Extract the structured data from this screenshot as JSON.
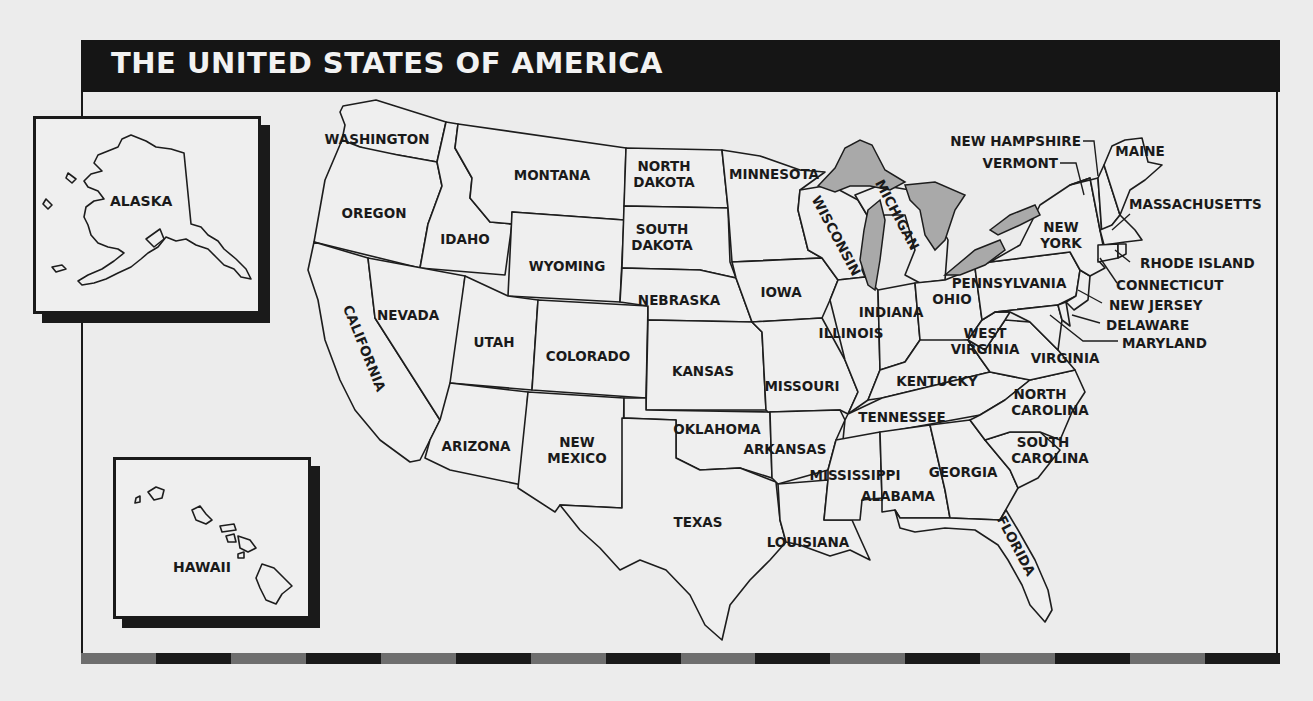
{
  "title": "THE UNITED STATES OF AMERICA",
  "colors": {
    "background": "#ececec",
    "title_bar": "#151515",
    "title_text": "#f2f2f2",
    "lakes": "#a9a9a9",
    "border": "#1a1a1a",
    "stripe_dark": "#1a1a1a",
    "stripe_light": "#6e6e6e"
  },
  "insets": {
    "alaska": {
      "label": "ALASKA"
    },
    "hawaii": {
      "label": "HAWAII"
    }
  },
  "states": {
    "washington": "WASHINGTON",
    "oregon": "OREGON",
    "california": "CALIFORNIA",
    "idaho": "IDAHO",
    "nevada": "NEVADA",
    "montana": "MONTANA",
    "wyoming": "WYOMING",
    "utah": "UTAH",
    "arizona": "ARIZONA",
    "colorado": "COLORADO",
    "new_mexico_1": "NEW",
    "new_mexico_2": "MEXICO",
    "north_dakota_1": "NORTH",
    "north_dakota_2": "DAKOTA",
    "south_dakota_1": "SOUTH",
    "south_dakota_2": "DAKOTA",
    "nebraska": "NEBRASKA",
    "kansas": "KANSAS",
    "oklahoma": "OKLAHOMA",
    "texas": "TEXAS",
    "minnesota": "MINNESOTA",
    "iowa": "IOWA",
    "missouri": "MISSOURI",
    "arkansas": "ARKANSAS",
    "louisiana": "LOUISIANA",
    "wisconsin": "WISCONSIN",
    "michigan": "MICHIGAN",
    "illinois": "ILLINOIS",
    "indiana": "INDIANA",
    "ohio": "OHIO",
    "kentucky": "KENTUCKY",
    "tennessee": "TENNESSEE",
    "mississippi": "MISSISSIPPI",
    "alabama": "ALABAMA",
    "georgia": "GEORGIA",
    "florida": "FLORIDA",
    "south_carolina_1": "SOUTH",
    "south_carolina_2": "CAROLINA",
    "north_carolina_1": "NORTH",
    "north_carolina_2": "CAROLINA",
    "virginia": "VIRGINIA",
    "west_virginia_1": "WEST",
    "west_virginia_2": "VIRGINIA",
    "pennsylvania": "PENNSYLVANIA",
    "new_york_1": "NEW",
    "new_york_2": "YORK",
    "new_jersey": "NEW JERSEY",
    "delaware": "DELAWARE",
    "maryland": "MARYLAND",
    "connecticut": "CONNECTICUT",
    "rhode_island": "RHODE ISLAND",
    "massachusetts": "MASSACHUSETTS",
    "vermont": "VERMONT",
    "new_hampshire": "NEW HAMPSHIRE",
    "maine": "MAINE"
  }
}
